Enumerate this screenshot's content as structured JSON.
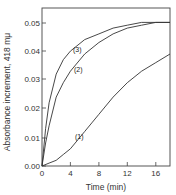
{
  "chart_data": {
    "type": "line",
    "title": "",
    "xlabel": "Time (min)",
    "ylabel": "Absorbance increment, 418 mμ",
    "xlim": [
      0,
      18
    ],
    "ylim": [
      0,
      0.055
    ],
    "xticks": [
      "0",
      "4",
      "8",
      "12",
      "16"
    ],
    "yticks": [
      "0.00",
      "0.01",
      "0.02",
      "0.03",
      "0.04",
      "0.05"
    ],
    "grid": false,
    "legend": "inline curve labels",
    "series": [
      {
        "name": "(1)",
        "x": [
          0,
          1,
          2,
          3,
          4,
          5,
          6,
          7,
          8,
          10,
          12,
          14,
          16,
          18
        ],
        "y": [
          0.0,
          0.001,
          0.002,
          0.004,
          0.006,
          0.009,
          0.012,
          0.015,
          0.018,
          0.024,
          0.029,
          0.033,
          0.036,
          0.039
        ]
      },
      {
        "name": "(2)",
        "x": [
          0,
          0.5,
          1,
          2,
          3,
          4,
          6,
          8,
          10,
          12,
          14,
          16,
          18
        ],
        "y": [
          0.0,
          0.008,
          0.014,
          0.024,
          0.029,
          0.033,
          0.039,
          0.043,
          0.046,
          0.048,
          0.049,
          0.05,
          0.05
        ]
      },
      {
        "name": "(3)",
        "x": [
          0,
          0.5,
          1,
          2,
          3,
          4,
          6,
          8,
          10,
          12,
          14,
          16,
          18
        ],
        "y": [
          0.0,
          0.013,
          0.022,
          0.032,
          0.037,
          0.04,
          0.044,
          0.046,
          0.048,
          0.049,
          0.05,
          0.05,
          0.05
        ]
      }
    ]
  },
  "labels": {
    "xlabel": "Time (min)",
    "ylabel": "Absorbance increment, 418 mμ",
    "xticks": [
      "0",
      "4",
      "8",
      "12",
      "16"
    ],
    "yticks": [
      "0.00",
      "0.01",
      "0.02",
      "0.03",
      "0.04",
      "0.05"
    ],
    "curve1": "(1)",
    "curve2": "(2)",
    "curve3": "(3)"
  }
}
